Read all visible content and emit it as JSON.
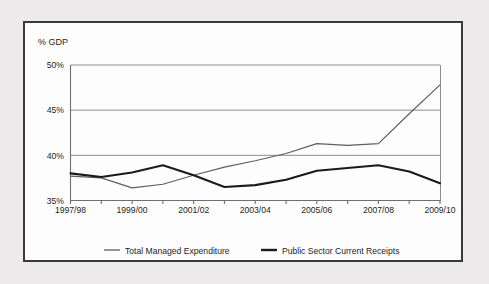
{
  "chart_data": {
    "type": "line",
    "title": "",
    "ylabel": "% GDP",
    "xlabel": "",
    "ylim": [
      35,
      50
    ],
    "yticks": [
      "35%",
      "40%",
      "45%",
      "50%"
    ],
    "ytick_values": [
      35,
      40,
      45,
      50
    ],
    "grid": true,
    "legend_position": "bottom",
    "categories": [
      "1997/98",
      "1998/99",
      "1999/00",
      "2000/01",
      "2001/02",
      "2002/03",
      "2003/04",
      "2004/05",
      "2005/06",
      "2006/07",
      "2007/08",
      "2008/09",
      "2009/10"
    ],
    "xtick_labels": [
      "1997/98",
      "1999/00",
      "2001/02",
      "2003/04",
      "2005/06",
      "2007/08",
      "2009/10"
    ],
    "series": [
      {
        "name": "Total Managed Expenditure",
        "color": "#5e5e5e",
        "values": [
          37.7,
          37.5,
          36.4,
          36.8,
          37.8,
          38.7,
          39.4,
          40.2,
          41.3,
          41.1,
          41.3,
          44.6,
          47.8
        ]
      },
      {
        "name": "Public Sector Current Receipts",
        "color": "#1b1b1b",
        "values": [
          38.0,
          37.6,
          38.1,
          38.9,
          37.8,
          36.5,
          36.7,
          37.3,
          38.3,
          38.6,
          38.9,
          38.2,
          36.9
        ]
      }
    ]
  },
  "legend": {
    "items": [
      {
        "label": "Total Managed Expenditure"
      },
      {
        "label": "Public Sector Current Receipts"
      }
    ]
  }
}
